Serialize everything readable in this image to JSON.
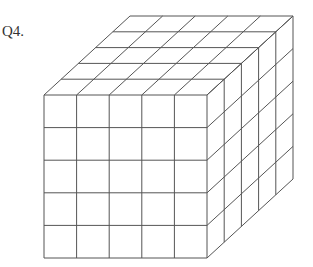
{
  "question": {
    "label": "Q4."
  },
  "figure": {
    "type": "cube-of-unit-cubes",
    "dimensions": {
      "width": 5,
      "height": 5,
      "depth": 5
    },
    "front_face": {
      "x": 44,
      "y": 95,
      "size": 163
    },
    "depth_offset": {
      "dx": 86,
      "dy": -79
    },
    "line_color": "#555555"
  }
}
